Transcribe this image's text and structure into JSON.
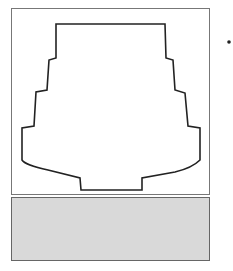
{
  "diagram": {
    "hall": {
      "label": "Fixed seating",
      "rows_per_side": 16
    },
    "lobby": {
      "label": "Lobby (Waiting area)",
      "fill": "#d9d9d9"
    },
    "pointer": {
      "from": "right-edge-dot",
      "to": "lobby"
    },
    "colors": {
      "line": "#222222",
      "box": "#666666",
      "lobby_fill": "#d9d9d9"
    }
  }
}
